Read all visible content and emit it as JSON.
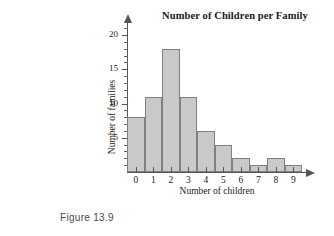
{
  "figure": {
    "caption": "Figure 13.9"
  },
  "chart_data": {
    "type": "bar",
    "title": "Number of Children per Family",
    "xlabel": "Number of children",
    "ylabel": "Number of families",
    "categories": [
      "0",
      "1",
      "2",
      "3",
      "4",
      "5",
      "6",
      "7",
      "8",
      "9"
    ],
    "values": [
      8,
      11,
      18,
      11,
      6,
      4,
      2,
      1,
      2,
      1
    ],
    "ylim": [
      0,
      21
    ],
    "xlim": [
      -0.5,
      9.5
    ],
    "y_major_ticks": [
      5,
      10,
      15,
      20
    ],
    "y_major_tick_labels": [
      "5",
      "10",
      "15",
      "20"
    ],
    "y_minor_tick_step": 1,
    "grid": false,
    "legend": false,
    "bar_style": {
      "fill": "#c9c9c9",
      "border": "#808080",
      "contiguous": true
    },
    "axis_style": {
      "color": "#555555",
      "y_axis_arrow": true,
      "x_axis_arrow": true
    }
  }
}
